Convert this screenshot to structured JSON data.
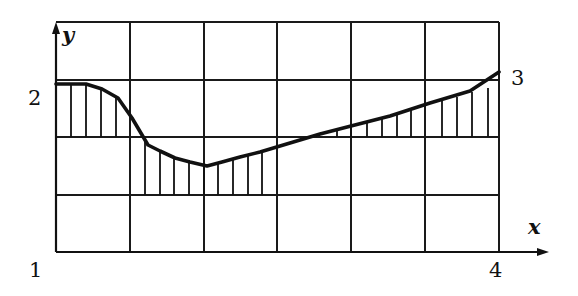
{
  "figure": {
    "type": "graph-diagram",
    "axes": {
      "x_label": "x",
      "y_label": "y"
    },
    "labels": {
      "origin": "1",
      "left_level": "2",
      "right_end": "3",
      "x_end": "4"
    },
    "grid": {
      "columns": 6,
      "rows": 4,
      "color": "#1a1a1a"
    },
    "curve": {
      "description": "Thick curve starting at level 2 on the left, dipping to a minimum near the third grid column, then rising linearly to point 3 on the right",
      "color": "#111111"
    },
    "hatching": {
      "style": "vertical lines between curve and reference grid line",
      "color": "#111111"
    }
  }
}
